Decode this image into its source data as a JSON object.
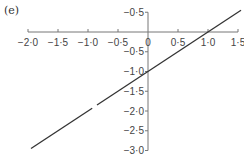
{
  "panel_label": "(e)",
  "chart_data": {
    "type": "line",
    "title": "",
    "xlabel": "",
    "ylabel": "",
    "xlim": [
      -2.0,
      1.5
    ],
    "ylim": [
      -3.0,
      0.5
    ],
    "x_ticks": [
      {
        "value": -2.0,
        "label": "−2·0"
      },
      {
        "value": -1.5,
        "label": "−1·5"
      },
      {
        "value": -1.0,
        "label": "−1·0"
      },
      {
        "value": -0.5,
        "label": "−0·5"
      },
      {
        "value": 0,
        "label": "0"
      },
      {
        "value": 0.5,
        "label": "0·5"
      },
      {
        "value": 1.0,
        "label": "1·0"
      },
      {
        "value": 1.5,
        "label": "1·5"
      }
    ],
    "y_ticks": [
      {
        "value": 0.5,
        "label": "−0·5"
      },
      {
        "value": -0.5,
        "label": "−0·5"
      },
      {
        "value": -1.0,
        "label": "−1·0"
      },
      {
        "value": -1.5,
        "label": "−1·5"
      },
      {
        "value": -2.0,
        "label": "−2·0"
      },
      {
        "value": -2.5,
        "label": "−2·5"
      },
      {
        "value": -3.0,
        "label": "−3·0"
      }
    ],
    "series": [
      {
        "name": "y = x − 1",
        "segments": [
          {
            "x": [
              -1.95,
              -0.93
            ],
            "y": [
              -2.95,
              -1.93
            ]
          },
          {
            "x": [
              -0.85,
              1.55
            ],
            "y": [
              -1.85,
              0.55
            ]
          }
        ]
      }
    ],
    "grid": false,
    "legend": "none",
    "colors": {
      "axis": "#777777",
      "line": "#333333"
    }
  }
}
